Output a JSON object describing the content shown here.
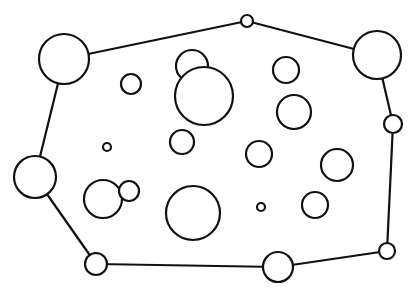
{
  "diagram": {
    "stroke_color": "#111111",
    "fill_color": "#ffffff",
    "hull_order": [
      "h1",
      "h2",
      "h3",
      "h4",
      "h5",
      "h6",
      "h7",
      "h8"
    ],
    "hull_nodes": [
      {
        "id": "h1",
        "cx": 64,
        "cy": 59,
        "r": 25
      },
      {
        "id": "h2",
        "cx": 247,
        "cy": 21,
        "r": 6
      },
      {
        "id": "h3",
        "cx": 377,
        "cy": 55,
        "r": 24
      },
      {
        "id": "h4",
        "cx": 393,
        "cy": 124,
        "r": 9
      },
      {
        "id": "h5",
        "cx": 387,
        "cy": 251,
        "r": 8
      },
      {
        "id": "h6",
        "cx": 278,
        "cy": 267,
        "r": 15
      },
      {
        "id": "h7",
        "cx": 96,
        "cy": 264,
        "r": 11
      },
      {
        "id": "h8",
        "cx": 35,
        "cy": 177,
        "r": 21
      }
    ],
    "interior_nodes": [
      {
        "id": "i1",
        "cx": 131,
        "cy": 84,
        "r": 10
      },
      {
        "id": "i2",
        "cx": 192,
        "cy": 66,
        "r": 16
      },
      {
        "id": "i3",
        "cx": 204,
        "cy": 96,
        "r": 29
      },
      {
        "id": "i4",
        "cx": 107,
        "cy": 147,
        "r": 4
      },
      {
        "id": "i5",
        "cx": 182,
        "cy": 142,
        "r": 12
      },
      {
        "id": "i6",
        "cx": 286,
        "cy": 70,
        "r": 13
      },
      {
        "id": "i7",
        "cx": 294,
        "cy": 112,
        "r": 17
      },
      {
        "id": "i8",
        "cx": 259,
        "cy": 154,
        "r": 13
      },
      {
        "id": "i9",
        "cx": 337,
        "cy": 165,
        "r": 16
      },
      {
        "id": "i10",
        "cx": 103,
        "cy": 199,
        "r": 19
      },
      {
        "id": "i11",
        "cx": 129,
        "cy": 191,
        "r": 10
      },
      {
        "id": "i12",
        "cx": 193,
        "cy": 213,
        "r": 27
      },
      {
        "id": "i13",
        "cx": 261,
        "cy": 207,
        "r": 4
      },
      {
        "id": "i14",
        "cx": 315,
        "cy": 205,
        "r": 13
      }
    ]
  }
}
